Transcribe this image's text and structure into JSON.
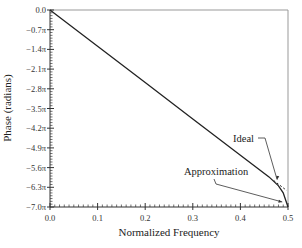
{
  "chart_data": {
    "type": "line",
    "title": "",
    "xlabel": "Normalized Frequency",
    "ylabel": "Phase (radians)",
    "xlim": [
      0.0,
      0.5
    ],
    "ylim_pi": [
      -7.0,
      0.0
    ],
    "x_ticks": [
      "0.0",
      "0.1",
      "0.2",
      "0.3",
      "0.4",
      "0.5"
    ],
    "y_ticks": [
      "0.0",
      "−0.7π",
      "−1.4π",
      "−2.1π",
      "−2.8π",
      "−3.5π",
      "−4.2π",
      "−4.9π",
      "−5.6π",
      "−6.3π",
      "−7.0π"
    ],
    "grid": false,
    "series": [
      {
        "name": "Ideal",
        "style": "solid-then-dashed",
        "x": [
          0.0,
          0.1,
          0.2,
          0.3,
          0.4,
          0.47,
          0.497
        ],
        "y_pi": [
          0.0,
          -1.29,
          -2.58,
          -3.87,
          -5.16,
          -6.06,
          -6.41
        ]
      },
      {
        "name": "Approximation",
        "style": "solid",
        "x": [
          0.0,
          0.1,
          0.2,
          0.3,
          0.4,
          0.46,
          0.48,
          0.49,
          0.5
        ],
        "y_pi": [
          0.0,
          -1.29,
          -2.58,
          -3.87,
          -5.16,
          -5.93,
          -6.25,
          -6.5,
          -7.0
        ]
      }
    ],
    "annotations": [
      {
        "text": "Ideal",
        "points_to": [
          0.475,
          -6.1
        ]
      },
      {
        "text": "Approximation",
        "points_to": [
          0.49,
          -6.75
        ]
      }
    ],
    "legend": "none (inline annotations)"
  }
}
